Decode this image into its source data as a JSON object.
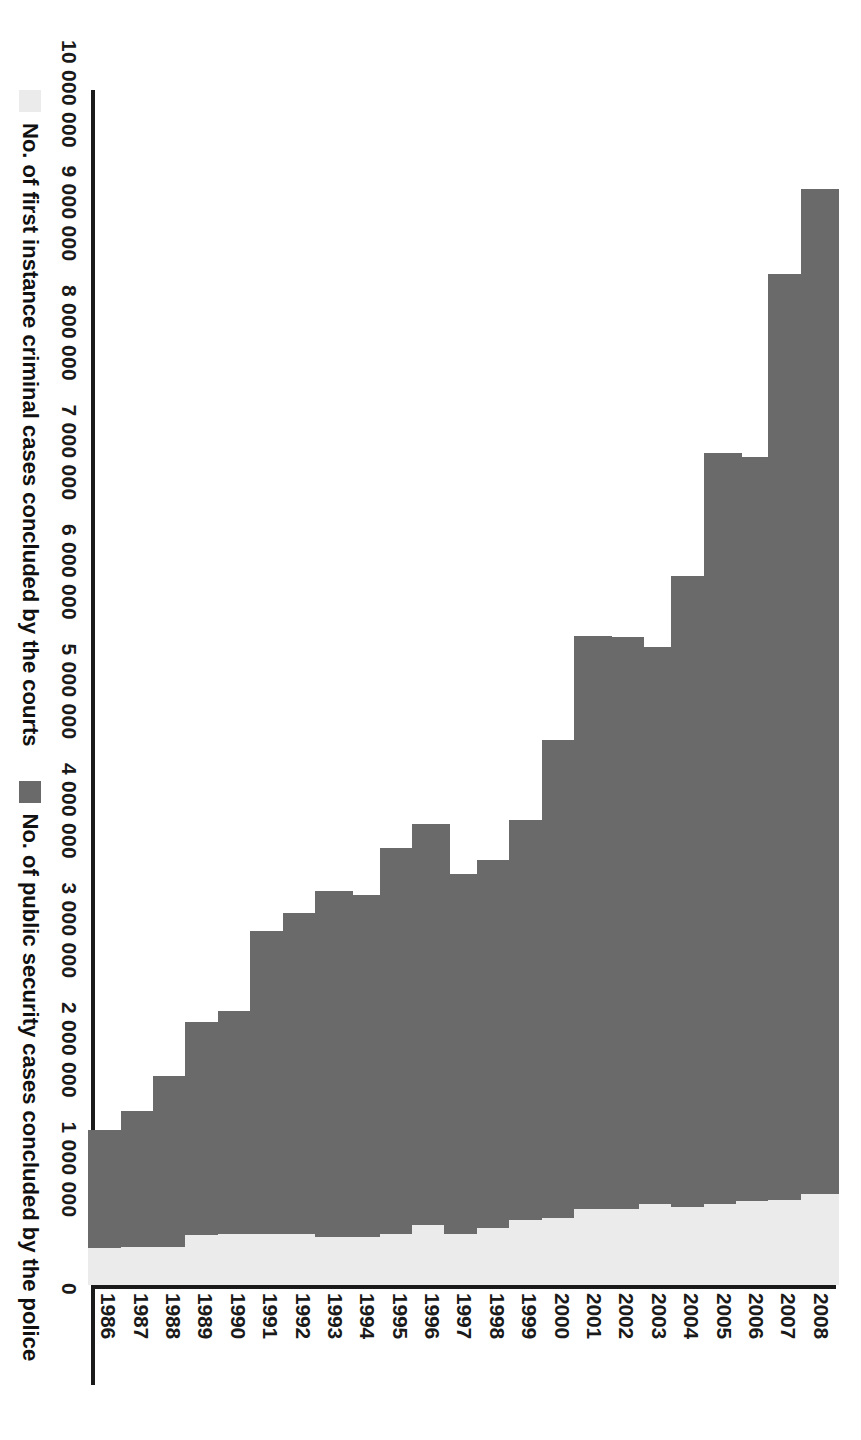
{
  "chart_data": {
    "type": "bar",
    "orientation": "horizontal-rotated",
    "title": "",
    "xlabel": "",
    "ylabel": "",
    "grid": false,
    "legend_position": "bottom-left",
    "value_axis_range": [
      0,
      10000000
    ],
    "value_ticks": [
      "0",
      "1 000 000",
      "2 000 000",
      "3 000 000",
      "4 000 000",
      "5 000 000",
      "6 000 000",
      "7 000 000",
      "8 000 000",
      "9 000 000",
      "10 000 000"
    ],
    "value_tick_values": [
      0,
      1000000,
      2000000,
      3000000,
      4000000,
      5000000,
      6000000,
      7000000,
      8000000,
      9000000,
      10000000
    ],
    "categories": [
      "1986",
      "1987",
      "1988",
      "1989",
      "1990",
      "1991",
      "1992",
      "1993",
      "1994",
      "1995",
      "1996",
      "1997",
      "1998",
      "1999",
      "2000",
      "2001",
      "2002",
      "2003",
      "2004",
      "2005",
      "2006",
      "2007",
      "2008"
    ],
    "series": [
      {
        "name": "No. of first instance criminal cases concluded by the courts",
        "color": "#ebebeb",
        "values": [
          310000,
          320000,
          320000,
          420000,
          430000,
          430000,
          430000,
          400000,
          400000,
          430000,
          500000,
          430000,
          480000,
          540000,
          560000,
          640000,
          640000,
          680000,
          650000,
          680000,
          700000,
          710000,
          760000
        ]
      },
      {
        "name": "No. of public security cases concluded by the police",
        "color": "#6a6a6a",
        "values": [
          990000,
          1140000,
          1430000,
          1780000,
          1860000,
          2530000,
          2680000,
          2900000,
          2860000,
          3230000,
          3360000,
          3010000,
          3080000,
          3350000,
          4000000,
          4790000,
          4780000,
          4660000,
          5280000,
          6280000,
          6230000,
          7750000,
          8410000
        ]
      }
    ],
    "stacked_totals": [
      1300000,
      1460000,
      1750000,
      2200000,
      2290000,
      2960000,
      3110000,
      3300000,
      3260000,
      3660000,
      3860000,
      3440000,
      3560000,
      3890000,
      4560000,
      5430000,
      5420000,
      5340000,
      5930000,
      6960000,
      6930000,
      8460000,
      9170000
    ]
  },
  "legend": {
    "entries": [
      {
        "label": "No. of first instance criminal cases concluded by the courts",
        "swatch": "courts"
      },
      {
        "label": "No. of public security cases concluded by the police",
        "swatch": "police"
      }
    ]
  }
}
